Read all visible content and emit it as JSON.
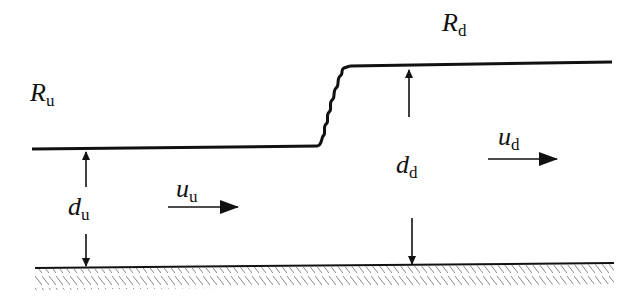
{
  "diagram": {
    "labels": {
      "R_u": {
        "main": "R",
        "sub": "u"
      },
      "R_d": {
        "main": "R",
        "sub": "d"
      },
      "u_u": {
        "main": "u",
        "sub": "u"
      },
      "u_d": {
        "main": "u",
        "sub": "d"
      },
      "d_u": {
        "main": "d",
        "sub": "u"
      },
      "d_d": {
        "main": "d",
        "sub": "d"
      }
    },
    "colors": {
      "line": "#111111",
      "hatch": "#777777",
      "background": "#ffffff"
    }
  }
}
